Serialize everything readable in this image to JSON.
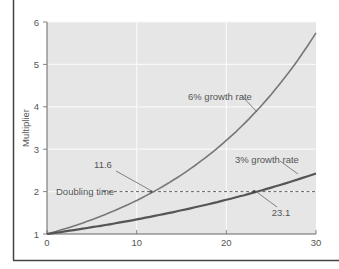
{
  "chart_data": {
    "type": "line",
    "title": "",
    "xlabel": "",
    "ylabel": "Multiplier",
    "xlim": [
      0,
      30
    ],
    "ylim": [
      1,
      6
    ],
    "x_ticks": [
      0,
      10,
      20,
      30
    ],
    "y_ticks": [
      1,
      2,
      3,
      4,
      5,
      6
    ],
    "x_tick_labels": [
      "0",
      "10",
      "20",
      "30"
    ],
    "y_tick_labels": [
      "1",
      "2",
      "3",
      "4",
      "5",
      "6"
    ],
    "grid": true,
    "legend": "none (inline labels)",
    "series": [
      {
        "name": "6% growth rate",
        "rate": 0.06,
        "x": [
          0,
          5,
          10,
          11.6,
          15,
          20,
          25,
          30
        ],
        "values": [
          1.0,
          1.34,
          1.79,
          2.0,
          2.4,
          3.21,
          4.29,
          5.74
        ],
        "color": "#777777"
      },
      {
        "name": "3% growth rate",
        "rate": 0.03,
        "x": [
          0,
          5,
          10,
          15,
          20,
          23.1,
          25,
          30
        ],
        "values": [
          1.0,
          1.16,
          1.34,
          1.56,
          1.81,
          2.0,
          2.09,
          2.43
        ],
        "color": "#555555"
      }
    ],
    "reference_lines": [
      {
        "type": "horizontal",
        "y": 2,
        "style": "dashed",
        "label": "Doubling time"
      }
    ],
    "annotations": [
      {
        "text": "6% growth rate",
        "points_to": "6% curve"
      },
      {
        "text": "3% growth rate",
        "points_to": "3% curve"
      },
      {
        "text": "11.6",
        "points_to": [
          11.6,
          2
        ]
      },
      {
        "text": "23.1",
        "points_to": [
          23.1,
          2
        ]
      },
      {
        "text": "Doubling time",
        "at_y": 2
      }
    ]
  },
  "labels": {
    "ylabel": "Multiplier",
    "y_ticks": [
      "1",
      "2",
      "3",
      "4",
      "5",
      "6"
    ],
    "x_ticks": [
      "0",
      "10",
      "20",
      "30"
    ],
    "series_6": "6% growth rate",
    "series_3": "3% growth rate",
    "doubling": "Doubling time",
    "dt6": "11.6",
    "dt3": "23.1"
  },
  "colors": {
    "plot_bg": "#e6e6e6",
    "grid": "#f8f8f8",
    "axis": "#666666",
    "curve_6": "#777777",
    "curve_3": "#555555",
    "text": "#555555",
    "frame": "#444444"
  }
}
